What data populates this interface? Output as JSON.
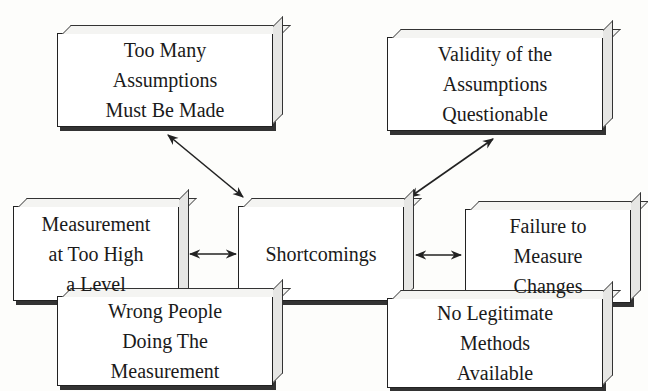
{
  "diagram": {
    "center": {
      "id": "shortcomings",
      "label": "Shortcomings"
    },
    "nodes": [
      {
        "id": "too-many-assumptions",
        "label": "Too Many\nAssumptions\nMust Be Made",
        "position": "top-left"
      },
      {
        "id": "validity-questionable",
        "label": "Validity of the\nAssumptions\nQuestionable",
        "position": "top-right"
      },
      {
        "id": "measurement-too-high",
        "label": "Measurement\nat Too High\na Level",
        "position": "middle-left"
      },
      {
        "id": "failure-to-measure",
        "label": "Failure to\nMeasure\nChanges",
        "position": "middle-right"
      },
      {
        "id": "wrong-people",
        "label": "Wrong People\nDoing The\nMeasurement",
        "position": "bottom-left"
      },
      {
        "id": "no-legitimate-methods",
        "label": "No Legitimate\nMethods\nAvailable",
        "position": "bottom-right"
      }
    ],
    "edges": [
      {
        "from": "shortcomings",
        "to": "too-many-assumptions",
        "type": "bidirectional"
      },
      {
        "from": "shortcomings",
        "to": "validity-questionable",
        "type": "bidirectional"
      },
      {
        "from": "shortcomings",
        "to": "measurement-too-high",
        "type": "bidirectional"
      },
      {
        "from": "shortcomings",
        "to": "failure-to-measure",
        "type": "bidirectional"
      },
      {
        "from": "shortcomings",
        "to": "wrong-people",
        "type": "bidirectional"
      },
      {
        "from": "shortcomings",
        "to": "no-legitimate-methods",
        "type": "bidirectional"
      }
    ],
    "colors": {
      "line": "#222222",
      "box_fill": "#ffffff",
      "background": "#fdfdfb"
    }
  }
}
